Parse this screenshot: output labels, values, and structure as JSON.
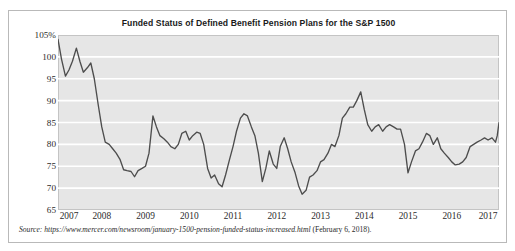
{
  "figure": {
    "title": "Funded Status of Defined Benefit Pension Plans for the S&P 1500",
    "source_lead": "Source:",
    "source_url": "https://www.mercer.com/newsroom/january-1500-pension-funded-status-increased.html",
    "source_date": "(February 6, 2018).",
    "line_color": "#4d4d4d",
    "plot_background": "#e6e6e6",
    "gridline_color": "#ffffff"
  },
  "chart_data": {
    "type": "line",
    "title": "Funded Status of Defined Benefit Pension Plans for the S&P 1500",
    "xlabel": "",
    "ylabel": "",
    "xlim": [
      2007.0,
      2017.08
    ],
    "ylim": [
      65,
      105
    ],
    "grid": true,
    "legend": "none",
    "y_ticks": [
      "105%",
      "100",
      "95",
      "90",
      "85",
      "80",
      "75",
      "70",
      "65"
    ],
    "y_tick_values": [
      105,
      100,
      95,
      90,
      85,
      80,
      75,
      70,
      65
    ],
    "x_ticks": [
      "2007",
      "2008",
      "2009",
      "2010",
      "2011",
      "2012",
      "2013",
      "2014",
      "2015",
      "2016",
      "2017"
    ],
    "x_tick_values": [
      2007,
      2008,
      2009,
      2010,
      2011,
      2012,
      2013,
      2014,
      2015,
      2016,
      2017
    ],
    "series": [
      {
        "name": "Funded Status",
        "x": [
          2007.0,
          2007.08,
          2007.17,
          2007.25,
          2007.33,
          2007.42,
          2007.5,
          2007.58,
          2007.67,
          2007.75,
          2007.83,
          2007.92,
          2008.0,
          2008.08,
          2008.17,
          2008.25,
          2008.33,
          2008.42,
          2008.5,
          2008.58,
          2008.67,
          2008.75,
          2008.83,
          2008.92,
          2009.0,
          2009.08,
          2009.17,
          2009.25,
          2009.33,
          2009.42,
          2009.5,
          2009.58,
          2009.67,
          2009.75,
          2009.83,
          2009.92,
          2010.0,
          2010.08,
          2010.17,
          2010.25,
          2010.33,
          2010.42,
          2010.5,
          2010.58,
          2010.67,
          2010.75,
          2010.83,
          2010.92,
          2011.0,
          2011.08,
          2011.17,
          2011.25,
          2011.33,
          2011.42,
          2011.5,
          2011.58,
          2011.67,
          2011.75,
          2011.83,
          2011.92,
          2012.0,
          2012.08,
          2012.17,
          2012.25,
          2012.33,
          2012.42,
          2012.5,
          2012.58,
          2012.67,
          2012.75,
          2012.83,
          2012.92,
          2013.0,
          2013.08,
          2013.17,
          2013.25,
          2013.33,
          2013.42,
          2013.5,
          2013.58,
          2013.67,
          2013.75,
          2013.83,
          2013.92,
          2014.0,
          2014.08,
          2014.17,
          2014.25,
          2014.33,
          2014.42,
          2014.5,
          2014.58,
          2014.67,
          2014.75,
          2014.83,
          2014.92,
          2015.0,
          2015.08,
          2015.17,
          2015.25,
          2015.33,
          2015.42,
          2015.5,
          2015.58,
          2015.67,
          2015.75,
          2015.83,
          2015.92,
          2016.0,
          2016.08,
          2016.17,
          2016.25,
          2016.33,
          2016.42,
          2016.5,
          2016.58,
          2016.67,
          2016.75,
          2016.83,
          2016.92,
          2017.0,
          2017.04,
          2017.08
        ],
        "values": [
          104.0,
          99.5,
          95.6,
          97.0,
          99.0,
          102.0,
          99.0,
          96.5,
          97.5,
          98.6,
          95.0,
          89.0,
          84.0,
          80.5,
          80.0,
          79.0,
          78.0,
          76.5,
          74.2,
          74.0,
          73.8,
          72.6,
          74.0,
          74.5,
          75.0,
          78.0,
          86.5,
          84.0,
          82.0,
          81.3,
          80.5,
          79.5,
          79.0,
          80.0,
          82.5,
          83.0,
          81.0,
          82.0,
          82.8,
          82.5,
          80.0,
          74.5,
          72.3,
          73.0,
          71.0,
          70.3,
          73.0,
          76.5,
          79.5,
          83.0,
          86.0,
          87.0,
          86.5,
          84.0,
          82.0,
          78.0,
          71.5,
          74.5,
          78.5,
          75.5,
          74.5,
          79.5,
          81.5,
          79.0,
          76.0,
          73.5,
          70.5,
          68.6,
          69.5,
          72.5,
          73.0,
          74.0,
          76.0,
          76.5,
          78.0,
          80.0,
          79.5,
          82.0,
          86.0,
          87.0,
          88.5,
          88.5,
          90.0,
          92.0,
          88.0,
          84.5,
          83.0,
          84.0,
          84.5,
          83.0,
          84.0,
          84.5,
          84.0,
          83.5,
          83.5,
          80.0,
          73.5,
          76.0,
          78.5,
          79.0,
          80.5,
          82.5,
          82.0,
          80.0,
          81.5,
          79.0,
          78.0,
          77.0,
          76.0,
          75.3,
          75.5,
          76.0,
          77.0,
          79.5,
          80.0,
          80.5,
          81.0,
          81.5,
          81.0,
          81.5,
          80.5,
          82.0,
          85.0
        ]
      }
    ]
  }
}
